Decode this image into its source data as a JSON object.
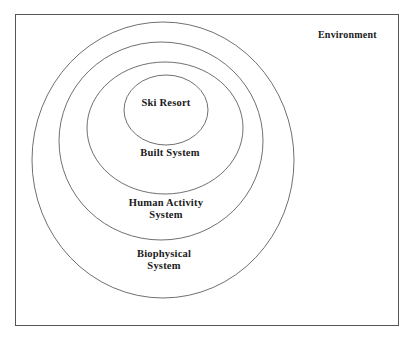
{
  "diagram": {
    "type": "nested-ellipses",
    "outer_label": "Environment",
    "layers": [
      {
        "id": "biophysical",
        "lines": [
          "Biophysical",
          "System"
        ]
      },
      {
        "id": "human-activity",
        "lines": [
          "Human Activity",
          "System"
        ]
      },
      {
        "id": "built",
        "lines": [
          "Built System"
        ]
      },
      {
        "id": "ski-resort",
        "lines": [
          "Ski Resort"
        ]
      }
    ],
    "colors": {
      "stroke": "#707070",
      "frame": "#555555",
      "text": "#1a1a1a",
      "background": "#ffffff"
    }
  }
}
